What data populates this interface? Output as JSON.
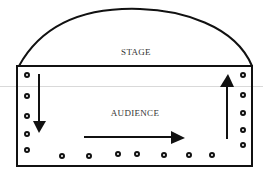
{
  "diagram": {
    "type": "stage-audience-flow",
    "labels": {
      "stage": "STAGE",
      "audience": "AUDIENCE"
    },
    "arrows": [
      {
        "direction": "down",
        "side": "left"
      },
      {
        "direction": "right",
        "side": "bottom"
      },
      {
        "direction": "up",
        "side": "right"
      }
    ],
    "seats": {
      "left_column": 5,
      "bottom_row": 7,
      "right_column": 5
    },
    "colors": {
      "stroke": "#111111",
      "background": "#ffffff",
      "text": "#333333"
    }
  }
}
